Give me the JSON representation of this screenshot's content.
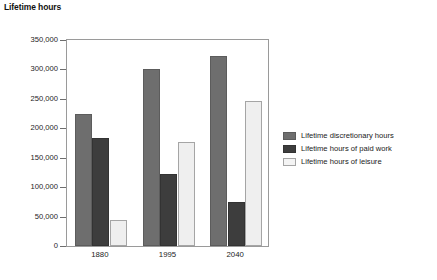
{
  "chart_data": {
    "type": "bar",
    "title": "Lifetime hours",
    "xlabel": "",
    "ylabel": "Lifetime hours",
    "categories": [
      "1880",
      "1995",
      "2040"
    ],
    "series": [
      {
        "name": "Lifetime discretionary hours",
        "color": "#6e6e6e",
        "values": [
          224000,
          301000,
          322000
        ]
      },
      {
        "name": "Lifetime hours of paid work",
        "color": "#3d3d3d",
        "values": [
          184000,
          122000,
          75000
        ]
      },
      {
        "name": "Lifetime hours of leisure",
        "color": "#efefef",
        "values": [
          45000,
          177000,
          247000
        ]
      }
    ],
    "ylim": [
      0,
      350000
    ],
    "ytick_values": [
      0,
      50000,
      100000,
      150000,
      200000,
      250000,
      300000,
      350000
    ],
    "ytick_labels": [
      "0",
      "50,000",
      "100,000",
      "150,000",
      "200,000",
      "250,000",
      "300,000",
      "350,000"
    ],
    "grid": false,
    "legend_position": "right"
  },
  "legend": {
    "items": [
      {
        "label": "Lifetime discretionary hours"
      },
      {
        "label": "Lifetime hours of paid work"
      },
      {
        "label": "Lifetime hours of leisure"
      }
    ]
  }
}
